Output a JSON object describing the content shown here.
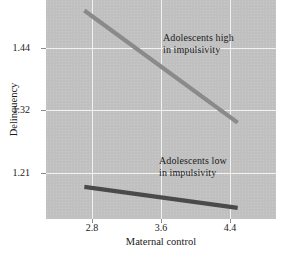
{
  "chart_data": {
    "type": "line",
    "title": "",
    "xlabel": "Maternal control",
    "ylabel": "Delinquency",
    "xlim": [
      2.4,
      4.8
    ],
    "ylim": [
      1.155,
      1.53
    ],
    "xticks": [
      "2.8",
      "3.6",
      "4.4"
    ],
    "yticks": [
      "1.44",
      "1.32",
      "1.21"
    ],
    "x": [
      2.8,
      4.4
    ],
    "grid": true,
    "legend_position": "inline-annotation",
    "series": [
      {
        "name": "Adolescents high in impulsivity",
        "values": [
          1.512,
          1.32
        ],
        "color": "#8a8a8a",
        "annotation_line1": "Adolescents high",
        "annotation_line2": "in impulsivity"
      },
      {
        "name": "Adolescents low in impulsivity",
        "values": [
          1.21,
          1.174
        ],
        "color": "#4a4a4a",
        "annotation_line1": "Adolescents low",
        "annotation_line2": "in impulsivity"
      }
    ],
    "plot_background": "#c0c0c0",
    "gridline_color": "#f2f2f2"
  },
  "axes": {
    "y_title": "Delinquency",
    "x_title": "Maternal control",
    "y_tick_labels": [
      "1.44",
      "1.32",
      "1.21"
    ],
    "x_tick_labels": [
      "2.8",
      "3.6",
      "4.4"
    ]
  },
  "annotations": {
    "high": {
      "line1": "Adolescents high",
      "line2": "in impulsivity"
    },
    "low": {
      "line1": "Adolescents low",
      "line2": "in impulsivity"
    }
  }
}
